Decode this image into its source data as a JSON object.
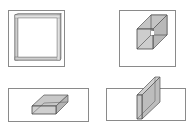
{
  "figure": {
    "panels": [
      {
        "id": "a",
        "shape": "square-frame",
        "description": "square frame viewed head-on inside a square box"
      },
      {
        "id": "b",
        "shape": "wireframe-cube",
        "description": "shaded cube with visible hidden edges inside a square box"
      },
      {
        "id": "c",
        "shape": "flat-slab",
        "description": "flat rectangular slab inside a wide rectangle"
      },
      {
        "id": "d",
        "shape": "vertical-slab",
        "description": "thin vertical slab crossing a wide rectangle"
      }
    ],
    "colors": {
      "border": "#8a8a8a",
      "edge": "#555555",
      "fill": "#c8c8c8",
      "fill_light": "#dcdcdc",
      "background": "#ffffff"
    }
  }
}
